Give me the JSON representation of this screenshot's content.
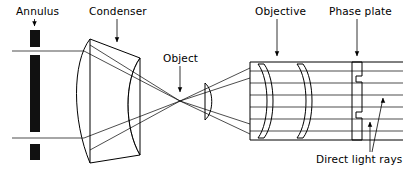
{
  "figure": {
    "background_color": "#ffffff",
    "ink_color": "#000000",
    "width": 403,
    "height": 174
  },
  "labels": {
    "annulus": "Annulus",
    "condenser": "Condenser",
    "object": "Object",
    "objective": "Objective",
    "phase_plate": "Phase plate",
    "direct_light_rays": "Direct light rays"
  },
  "components": [
    {
      "name": "annulus",
      "label": "Annulus",
      "type": "aperture-stop",
      "description": "Opaque annular stop drawn as three stacked black bars with two transparent gaps",
      "bars": [
        {
          "x": 30,
          "y": 30,
          "width": 10,
          "height": 17
        },
        {
          "x": 30,
          "y": 55,
          "width": 10,
          "height": 77
        },
        {
          "x": 30,
          "y": 144,
          "width": 10,
          "height": 16
        }
      ],
      "gaps": [
        {
          "y": 51
        },
        {
          "y": 138
        }
      ]
    },
    {
      "name": "condenser",
      "label": "Condenser",
      "type": "lens",
      "description": "Large biconvex condenser lens drawn in 3D perspective"
    },
    {
      "name": "object",
      "label": "Object",
      "type": "specimen-point",
      "description": "Specimen plane where the illuminating cone comes to a focus"
    },
    {
      "name": "objective",
      "label": "Objective",
      "type": "lens-assembly",
      "description": "Objective barrel containing two biconvex lens elements",
      "element_count": 2
    },
    {
      "name": "phase-plate",
      "label": "Phase plate",
      "type": "phase-plate",
      "description": "Hatched plate with two stepped notches that retard the direct light"
    }
  ],
  "annotations": [
    {
      "name": "annulus-pointer",
      "label": "Annulus",
      "arrow": "down"
    },
    {
      "name": "condenser-pointer",
      "label": "Condenser",
      "arrow": "down"
    },
    {
      "name": "object-pointer",
      "label": "Object",
      "arrow": "down"
    },
    {
      "name": "objective-pointer",
      "label": "Objective",
      "arrow": "down"
    },
    {
      "name": "phase-plate-pointer",
      "label": "Phase plate",
      "arrow": "down"
    },
    {
      "name": "direct-light-rays-pointer",
      "label": "Direct light rays",
      "arrow": "up",
      "arrow_count": 2
    }
  ],
  "rays": {
    "description": "Two illuminating beams leave the annulus gaps, are refracted by the condenser, cross at the object, expand through the objective and emerge as parallel rays through the phase plate",
    "parallel_exit_ray_count": 6
  }
}
